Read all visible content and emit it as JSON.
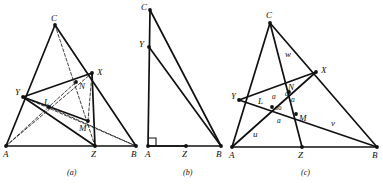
{
  "figure": {
    "width": 383,
    "height": 189,
    "background": "#ffffff",
    "ink": "#111111",
    "panels": [
      {
        "id": "a",
        "caption": "(a)",
        "caption_pos": [
          67,
          168
        ],
        "points": {
          "A": [
            6,
            146
          ],
          "B": [
            136,
            146
          ],
          "C": [
            55,
            25
          ],
          "X": [
            92,
            73
          ],
          "Y": [
            23,
            97
          ],
          "Z": [
            95,
            146
          ],
          "L": [
            49,
            107
          ],
          "M": [
            88,
            121
          ],
          "N": [
            76,
            82
          ]
        },
        "labels": [
          {
            "text": "C",
            "x": 51,
            "y": 14,
            "name": "label-c"
          },
          {
            "text": "X",
            "x": 97,
            "y": 68,
            "name": "label-x"
          },
          {
            "text": "Y",
            "x": 15,
            "y": 88,
            "name": "label-y"
          },
          {
            "text": "L",
            "x": 44,
            "y": 98,
            "name": "label-l"
          },
          {
            "text": "N",
            "x": 79,
            "y": 82,
            "name": "label-n"
          },
          {
            "text": "M",
            "x": 79,
            "y": 124,
            "name": "label-m"
          },
          {
            "text": "A",
            "x": 3,
            "y": 150,
            "name": "label-a"
          },
          {
            "text": "Z",
            "x": 91,
            "y": 150,
            "name": "label-z"
          },
          {
            "text": "B",
            "x": 131,
            "y": 150,
            "name": "label-b"
          }
        ],
        "solid_edges": [
          [
            "A",
            "C"
          ],
          [
            "C",
            "B"
          ],
          [
            "A",
            "B"
          ],
          [
            "Y",
            "X"
          ],
          [
            "Y",
            "Z"
          ],
          [
            "X",
            "Z"
          ],
          [
            "Y",
            "M"
          ]
        ],
        "dashed_edges": [
          [
            "C",
            "Z"
          ],
          [
            "A",
            "X"
          ],
          [
            "A",
            "N"
          ],
          [
            "Y",
            "B"
          ],
          [
            "X",
            "M"
          ],
          [
            "L",
            "B"
          ]
        ],
        "dots": [
          "A",
          "B",
          "C",
          "X",
          "Y",
          "Z",
          "L",
          "M",
          "N"
        ]
      },
      {
        "id": "b",
        "caption": "(b)",
        "caption_pos": [
          183,
          168
        ],
        "points": {
          "A": [
            148,
            146
          ],
          "B": [
            221,
            146
          ],
          "C": [
            150,
            10
          ],
          "Y": [
            149,
            47
          ],
          "Z": [
            186,
            146
          ]
        },
        "labels": [
          {
            "text": "C",
            "x": 141,
            "y": 3,
            "name": "label-c"
          },
          {
            "text": "Y",
            "x": 139,
            "y": 40,
            "name": "label-y"
          },
          {
            "text": "A",
            "x": 145,
            "y": 150,
            "name": "label-a"
          },
          {
            "text": "Z",
            "x": 182,
            "y": 150,
            "name": "label-z"
          },
          {
            "text": "B",
            "x": 216,
            "y": 150,
            "name": "label-b"
          }
        ],
        "solid_edges": [
          [
            "C",
            "A"
          ],
          [
            "C",
            "B"
          ],
          [
            "Y",
            "B"
          ],
          [
            "A",
            "B"
          ],
          [
            "A",
            "Z"
          ]
        ],
        "dashed_edges": [],
        "right_angle": {
          "vertex": "A",
          "size": 8,
          "name": "right-angle-marker"
        },
        "dots": [
          "A",
          "B",
          "C",
          "Y",
          "Z"
        ]
      },
      {
        "id": "c",
        "caption": "(c)",
        "caption_pos": [
          301,
          168
        ],
        "points": {
          "A": [
            232,
            147
          ],
          "B": [
            377,
            147
          ],
          "C": [
            270,
            23
          ],
          "X": [
            316,
            72
          ],
          "Y": [
            239,
            100
          ],
          "Z": [
            302,
            147
          ],
          "L": [
            272,
            107
          ],
          "M": [
            296,
            114
          ],
          "N": [
            289,
            92
          ]
        },
        "labels": [
          {
            "text": "C",
            "x": 266,
            "y": 11,
            "name": "label-c"
          },
          {
            "text": "X",
            "x": 321,
            "y": 66,
            "name": "label-x"
          },
          {
            "text": "Y",
            "x": 231,
            "y": 92,
            "name": "label-y"
          },
          {
            "text": "N",
            "x": 288,
            "y": 83,
            "name": "label-n"
          },
          {
            "text": "L",
            "x": 258,
            "y": 97,
            "name": "label-l"
          },
          {
            "text": "M",
            "x": 299,
            "y": 114,
            "name": "label-m"
          },
          {
            "text": "A",
            "x": 229,
            "y": 151,
            "name": "label-a"
          },
          {
            "text": "Z",
            "x": 298,
            "y": 151,
            "name": "label-z"
          },
          {
            "text": "B",
            "x": 372,
            "y": 151,
            "name": "label-b"
          },
          {
            "text": "w",
            "x": 285,
            "y": 50,
            "name": "label-w"
          },
          {
            "text": "v",
            "x": 331,
            "y": 119,
            "name": "label-v"
          },
          {
            "text": "u",
            "x": 253,
            "y": 130,
            "name": "label-u"
          }
        ],
        "side_labels": [
          {
            "text": "a",
            "x": 272,
            "y": 93,
            "name": "label-side-a-top-left"
          },
          {
            "text": "a",
            "x": 291,
            "y": 96,
            "name": "label-side-a-top-right"
          },
          {
            "text": "a",
            "x": 285,
            "y": 90,
            "name": "label-side-a-inner"
          },
          {
            "text": "a",
            "x": 277,
            "y": 117,
            "name": "label-side-a-bottom"
          }
        ],
        "angle_label": {
          "text": "60",
          "x": 275,
          "y": 105,
          "name": "label-angle-60"
        },
        "solid_edges": [
          [
            "A",
            "C"
          ],
          [
            "C",
            "B"
          ],
          [
            "A",
            "B"
          ],
          [
            "C",
            "Z"
          ],
          [
            "Y",
            "X"
          ],
          [
            "Y",
            "B"
          ],
          [
            "A",
            "X"
          ]
        ],
        "dashed_edges": [],
        "dots": [
          "A",
          "B",
          "C",
          "X",
          "Y",
          "Z",
          "L",
          "M",
          "N"
        ]
      }
    ]
  }
}
